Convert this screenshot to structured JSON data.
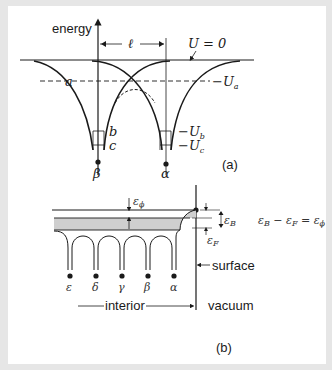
{
  "figure": {
    "panel_a": {
      "axis_label": "energy",
      "spacing_label": "ℓ",
      "zero_level_label": "U = 0",
      "level_labels": [
        "−Uₐ",
        "−U_b",
        "−U_c"
      ],
      "well_labels": {
        "a": "a",
        "b": "b",
        "c": "c"
      },
      "atoms": [
        "β",
        "α"
      ],
      "caption": "(a)"
    },
    "panel_b": {
      "work_function_label": "ε",
      "work_function_sub": "ϕ",
      "band_label": "ε",
      "band_sub": "B",
      "fermi_label": "ε",
      "fermi_sub": "F",
      "relation": "εB − εF = εϕ",
      "surface_label": "surface",
      "interior_label": "interior",
      "vacuum_label": "vacuum",
      "atoms": [
        "ε",
        "δ",
        "γ",
        "β",
        "α"
      ],
      "caption": "(b)"
    },
    "colors": {
      "frame": "#e6e6e6",
      "panel": "#ffffff",
      "ink": "#1a1a1a",
      "band_fill": "#cfcfcf"
    }
  }
}
